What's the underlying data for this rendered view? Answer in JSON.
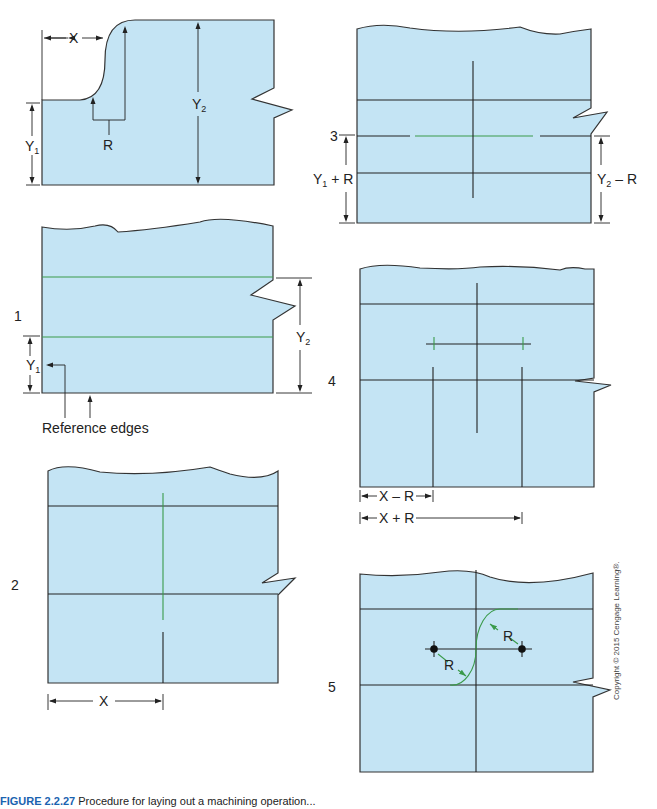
{
  "figure": {
    "caption_label": "FIGURE 2.2.27",
    "caption_text": "Procedure for laying out a machining operation..."
  },
  "copyright": "Copyright © 2015 Cengage Learning®.",
  "panels": {
    "part": {
      "labels": {
        "x": "X",
        "y1": "Y",
        "y1_sub": "1",
        "y2": "Y",
        "y2_sub": "2",
        "r": "R"
      }
    },
    "step1": {
      "number": "1",
      "labels": {
        "y1": "Y",
        "y1_sub": "1",
        "y2": "Y",
        "y2_sub": "2",
        "reference": "Reference edges"
      }
    },
    "step2": {
      "number": "2",
      "labels": {
        "x": "X"
      }
    },
    "step3": {
      "number": "3",
      "labels": {
        "y1r_main": "Y",
        "y1r_sub": "1",
        "y1r_tail": " + R",
        "y2r_main": "Y",
        "y2r_sub": "2",
        "y2r_tail": " – R"
      }
    },
    "step4": {
      "number": "4",
      "labels": {
        "xminus": "X – R",
        "xplus": "X + R"
      }
    },
    "step5": {
      "number": "5",
      "labels": {
        "r1": "R",
        "r2": "R"
      }
    }
  }
}
